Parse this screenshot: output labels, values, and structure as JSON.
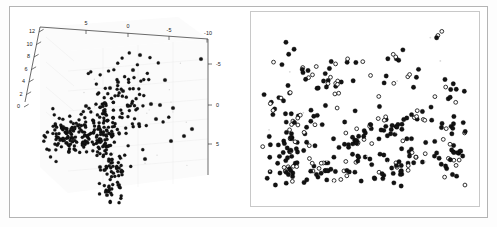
{
  "figure": {
    "background_color": "#ffffff",
    "frame_color": "#b4b4b4",
    "width": 497,
    "height": 227
  },
  "chart_data": [
    {
      "id": "left-3d-scatter",
      "type": "scatter",
      "projection": "3d",
      "title": "",
      "xlabel": "",
      "ylabel": "",
      "zlabel": "",
      "grid": true,
      "legend": null,
      "axes": {
        "top_axis": {
          "name": "x",
          "ticks": [
            5,
            0,
            -5,
            -10
          ],
          "tick_labels": [
            "5",
            "0",
            "-5",
            "-10"
          ],
          "direction": "decreasing-left-to-right",
          "range": [
            8,
            -12
          ]
        },
        "left_axis": {
          "name": "z",
          "ticks": [
            0,
            2,
            4,
            6,
            8,
            10,
            12
          ],
          "tick_labels": [
            "0",
            "2",
            "4",
            "6",
            "8",
            "10",
            "12"
          ],
          "range": [
            -1,
            13
          ]
        },
        "right_axis": {
          "name": "y",
          "ticks": [
            -5,
            0,
            5
          ],
          "tick_labels": [
            "-5",
            "0",
            "5"
          ],
          "range": [
            -8,
            8
          ]
        }
      },
      "marker": {
        "style": "filled-circle",
        "color": "#141414",
        "size_px": 2.1
      },
      "point_count": 420,
      "description": "Dense elongated cluster in lower-left quadrant with a sparse scatter of outliers toward upper right"
    },
    {
      "id": "right-2d-scatter",
      "type": "scatter",
      "title": "",
      "xlabel": "",
      "ylabel": "",
      "grid": false,
      "legend": null,
      "axes": {
        "x": {
          "ticks": [],
          "tick_labels": [],
          "visible": false
        },
        "y": {
          "ticks": [],
          "tick_labels": [],
          "visible": false
        }
      },
      "series": [
        {
          "name": "filled",
          "marker": "filled-circle",
          "color": "#131313",
          "point_count": 205
        },
        {
          "name": "open",
          "marker": "open-circle",
          "color": "#0f0f0f",
          "point_count": 120
        }
      ],
      "point_count": 325,
      "description": "Uniform scatter of filled and hollow circular markers, density increasing toward the lower portion of the panel"
    }
  ]
}
